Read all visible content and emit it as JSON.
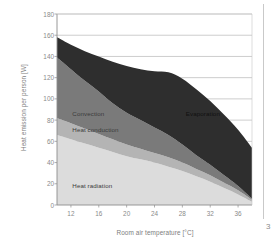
{
  "page": {
    "number": "3"
  },
  "chart_data": {
    "type": "area",
    "stacked": true,
    "title": "",
    "xlabel": "Room air temperature [°C]",
    "ylabel": "Heat emission per person [W]",
    "xlim": [
      10,
      38
    ],
    "ylim": [
      0,
      180
    ],
    "xticks": [
      12,
      16,
      20,
      24,
      28,
      32,
      36
    ],
    "yticks": [
      0,
      20,
      40,
      60,
      80,
      100,
      120,
      140,
      160,
      180
    ],
    "grid": "horizontal",
    "legend_position": "inline-annotations",
    "x": [
      10,
      12,
      14,
      16,
      18,
      20,
      22,
      24,
      26,
      28,
      30,
      32,
      34,
      36,
      38
    ],
    "series": [
      {
        "name": "Heat radiation",
        "color": "#dcdcdc",
        "values": [
          66,
          62,
          58,
          54,
          50,
          46,
          43,
          40,
          36,
          32,
          27,
          22,
          16,
          10,
          3
        ]
      },
      {
        "name": "Heat conduction",
        "color": "#b4b4b4",
        "values": [
          16,
          15,
          14,
          13,
          12,
          11,
          10,
          9,
          9,
          8,
          7,
          6,
          5,
          4,
          2
        ]
      },
      {
        "name": "Convection",
        "color": "#7a7a7a",
        "values": [
          57,
          51,
          45,
          40,
          34,
          30,
          27,
          24,
          21,
          17,
          13,
          10,
          7,
          4,
          1
        ]
      },
      {
        "name": "Evaporation",
        "color": "#2e2e2e",
        "values": [
          19,
          23,
          28,
          33,
          39,
          44,
          48,
          53,
          59,
          62,
          62,
          60,
          57,
          53,
          48
        ]
      }
    ],
    "totals": [
      158,
      151,
      145,
      140,
      135,
      131,
      128,
      126,
      125,
      119,
      109,
      98,
      85,
      71,
      54
    ],
    "annotations": [
      {
        "text": "Convection",
        "x": 12.2,
        "y": 86
      },
      {
        "text": "Heat conduction",
        "x": 12.2,
        "y": 71
      },
      {
        "text": "Heat radiation",
        "x": 12.2,
        "y": 18
      },
      {
        "text": "Evaporation",
        "x": 28.5,
        "y": 86
      }
    ]
  }
}
